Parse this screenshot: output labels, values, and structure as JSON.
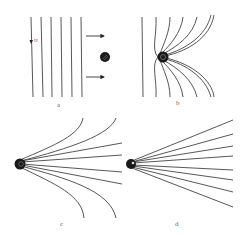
{
  "figure": {
    "panels": [
      {
        "id": "a",
        "label": "a",
        "description": "uniform vertical field lines H; conducting sphere approaching from left (arrows pointing right)"
      },
      {
        "id": "b",
        "label": "b",
        "description": "field lines bending toward sphere"
      },
      {
        "id": "c",
        "label": "c",
        "description": "field lines converging strongly on sphere"
      },
      {
        "id": "d",
        "label": "d",
        "description": "field lines radiating straight from sphere"
      }
    ],
    "field_symbol": "H",
    "colors": {
      "line": "#444444",
      "sphere": "#1a1a1a",
      "background": "#ffffff"
    }
  }
}
